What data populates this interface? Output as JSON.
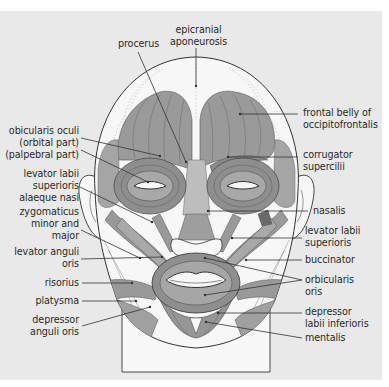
{
  "figure": {
    "colors": {
      "background": "#e9e9e9",
      "muscle_fill": "#9a9a9a",
      "muscle_dark": "#7d7d7d",
      "skin": "#f7f7f7",
      "line": "#333333"
    }
  },
  "labels": {
    "procerus": [
      "procerus"
    ],
    "epicranial": [
      "epicranial",
      "aponeurosis"
    ],
    "frontal": [
      "frontal belly of",
      "occipitofrontalis"
    ],
    "corrugator": [
      "corrugator",
      "supercilii"
    ],
    "orbicularis_oculi": [
      "obicularis oculi",
      "(orbital part)",
      "(palpebral part)"
    ],
    "lev_labii_alaeque": [
      "levator labii",
      "superioris",
      "alaeque nasi"
    ],
    "zygomaticus": [
      "zygomaticus",
      "minor and",
      "major"
    ],
    "nasalis": [
      "nasalis"
    ],
    "lev_labii_sup": [
      "levator labii",
      "superioris"
    ],
    "lev_anguli": [
      "levator anguli",
      "oris"
    ],
    "buccinator": [
      "buccinator"
    ],
    "risorius": [
      "risorius"
    ],
    "orbicularis_oris": [
      "orbicularis",
      "oris"
    ],
    "platysma": [
      "platysma"
    ],
    "dep_labii": [
      "depressor",
      "labii inferioris"
    ],
    "dep_anguli": [
      "depressor",
      "anguli oris"
    ],
    "mentalis": [
      "mentalis"
    ]
  }
}
